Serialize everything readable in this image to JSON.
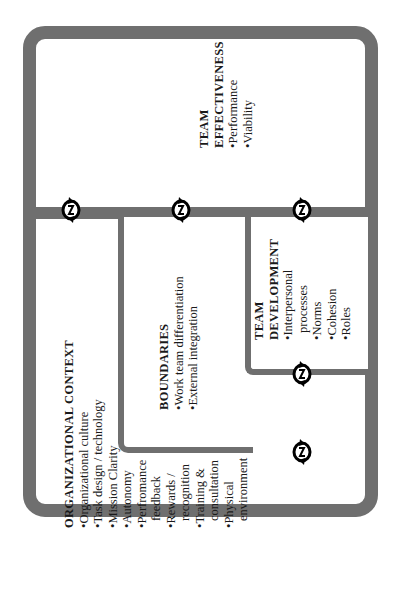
{
  "diagram": {
    "orientation": "rotated-90-ccw",
    "colors": {
      "frame": "#6f6f6f",
      "background": "#ffffff",
      "text": "#1a1a1a"
    },
    "sections": {
      "team_effectiveness": {
        "title_line1": "TEAM",
        "title_line2": "EFFECTIVENESS",
        "items": [
          "•Performance",
          "•Viability"
        ]
      },
      "organizational_context": {
        "title": "ORGANIZATIONAL CONTEXT",
        "items": [
          "•Organizational culture",
          "•Task design / technology",
          "•Mission Clarity",
          "•Autonomy",
          "•Perfromance",
          "  feedback",
          "•Rewards /",
          "  recognition",
          "•Training &",
          "  consultation",
          "•Physical",
          "  environment"
        ]
      },
      "boundaries": {
        "title": "BOUNDARIES",
        "items": [
          "•Work team differentiation",
          "•External integration"
        ]
      },
      "team_development": {
        "title_line1": "TEAM",
        "title_line2": "DEVELOPMENT",
        "items": [
          "•Interpersonal",
          "  processes",
          "•Norms",
          "•Cohesion",
          "•Roles"
        ]
      }
    },
    "connectors": [
      {
        "name": "org-context-to-effectiveness",
        "icon": "cycle-arrows-icon"
      },
      {
        "name": "boundaries-to-effectiveness",
        "icon": "cycle-arrows-icon"
      },
      {
        "name": "team-development-to-effectiveness",
        "icon": "cycle-arrows-icon"
      },
      {
        "name": "team-development-to-boundaries",
        "icon": "cycle-arrows-icon"
      },
      {
        "name": "boundaries-to-org-context",
        "icon": "cycle-arrows-icon"
      }
    ]
  }
}
